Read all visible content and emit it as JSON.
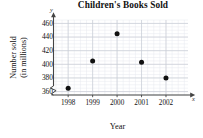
{
  "chart_data": {
    "type": "scatter",
    "title": "Children's Books Sold",
    "xlabel": "Year",
    "ylabel_line1": "Number sold",
    "ylabel_line2": "(in millions)",
    "axis_var_x": "x",
    "axis_var_y": "y",
    "categories": [
      "1998",
      "1999",
      "2000",
      "2001",
      "2002"
    ],
    "x": [
      1998,
      1999,
      2000,
      2001,
      2002
    ],
    "values": [
      365,
      405,
      445,
      403,
      380
    ],
    "points": [
      {
        "x": "1998",
        "y": 365
      },
      {
        "x": "1999",
        "y": 405
      },
      {
        "x": "2000",
        "y": 445
      },
      {
        "x": "2001",
        "y": 403
      },
      {
        "x": "2002",
        "y": 380
      }
    ],
    "ylim": [
      355,
      465
    ],
    "xlim": [
      1997.4,
      2002.9
    ],
    "yticks": [
      360,
      380,
      400,
      420,
      440,
      460
    ],
    "ytick_labels": [
      "360",
      "380",
      "400",
      "420",
      "440",
      "460"
    ],
    "xtick_labels": [
      "1998",
      "1999",
      "2000",
      "2001",
      "2002"
    ],
    "grid": true,
    "grid_minor": true,
    "minor_divisions": 4,
    "axis_break_y": true,
    "legend": null,
    "legend_position": "none",
    "colors": {
      "point": "#111111",
      "axis": "#444444",
      "grid_major": "#c9cdd6",
      "grid_minor": "#e6e9ef",
      "text": "#111111",
      "background": "#ffffff"
    }
  }
}
